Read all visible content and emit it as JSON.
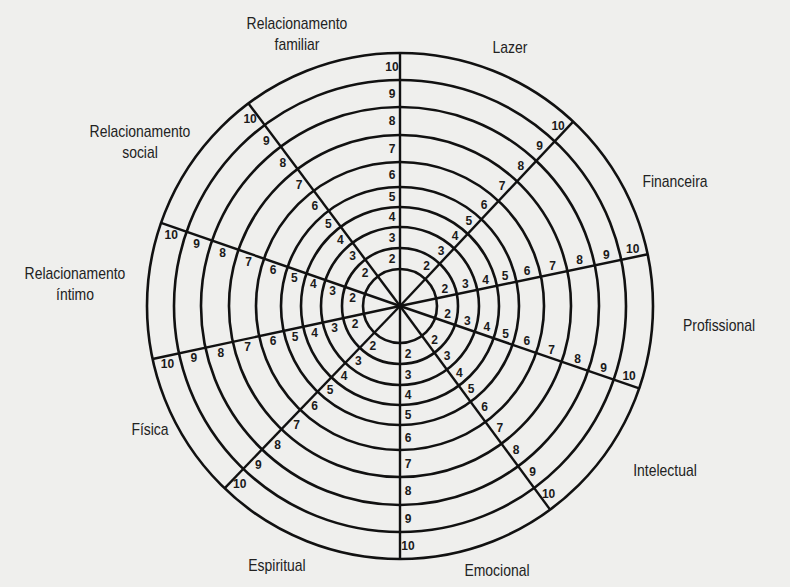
{
  "diagram": {
    "type": "wheel_of_life",
    "center": [
      400,
      306
    ],
    "scale": [
      "1",
      "2",
      "3",
      "4",
      "5",
      "6",
      "7",
      "8",
      "9",
      "10"
    ],
    "areas": [
      {
        "label_line1": "Relacionamento",
        "label_line2": "familiar"
      },
      {
        "label_line1": "Lazer",
        "label_line2": ""
      },
      {
        "label_line1": "Financeira",
        "label_line2": ""
      },
      {
        "label_line1": "Profissional",
        "label_line2": ""
      },
      {
        "label_line1": "Intelectual",
        "label_line2": ""
      },
      {
        "label_line1": "Emocional",
        "label_line2": ""
      },
      {
        "label_line1": "Espiritual",
        "label_line2": ""
      },
      {
        "label_line1": "Física",
        "label_line2": ""
      },
      {
        "label_line1": "Relacionamento",
        "label_line2": "íntimo"
      },
      {
        "label_line1": "Relacionamento",
        "label_line2": "social"
      }
    ]
  },
  "colors": {
    "line": "#111111",
    "background": "#efefed"
  }
}
